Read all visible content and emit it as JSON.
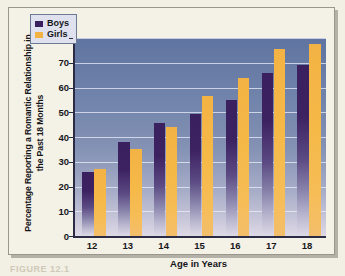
{
  "figure": {
    "caption": "FIGURE 12.1"
  },
  "legend": {
    "position": "top-left-inside",
    "entries": [
      {
        "label": "Boys",
        "color": "#3b2060",
        "swatch": "boys-swatch"
      },
      {
        "label": "Girls",
        "color": "#f3b344",
        "swatch": "girls-swatch"
      }
    ]
  },
  "axes": {
    "y_title": "Percentage Reporting a Romantic Relationship in the Past 18 Months",
    "x_title": "Age in Years",
    "y_ticks": [
      "0",
      "10",
      "20",
      "30",
      "40",
      "50",
      "60",
      "70",
      "80"
    ],
    "x_ticks": [
      "12",
      "13",
      "14",
      "15",
      "16",
      "17",
      "18"
    ]
  },
  "chart_data": {
    "type": "bar",
    "title": "",
    "xlabel": "Age in Years",
    "ylabel": "Percentage Reporting a Romantic Relationship in the Past 18 Months",
    "categories": [
      "12",
      "13",
      "14",
      "15",
      "16",
      "17",
      "18"
    ],
    "series": [
      {
        "name": "Boys",
        "color": "#3b2060",
        "values": [
          26,
          38,
          45.5,
          49.5,
          55,
          66,
          69
        ]
      },
      {
        "name": "Girls",
        "color": "#f3b344",
        "values": [
          27,
          35,
          44,
          56.5,
          64,
          75.5,
          77.5
        ]
      }
    ],
    "ylim": [
      0,
      80
    ],
    "ytick_step": 10,
    "grid": true,
    "grid_axis": "y",
    "legend": [
      "Boys",
      "Girls"
    ],
    "legend_position": "upper left",
    "plot_background": "blue-gray vertical gradient"
  }
}
